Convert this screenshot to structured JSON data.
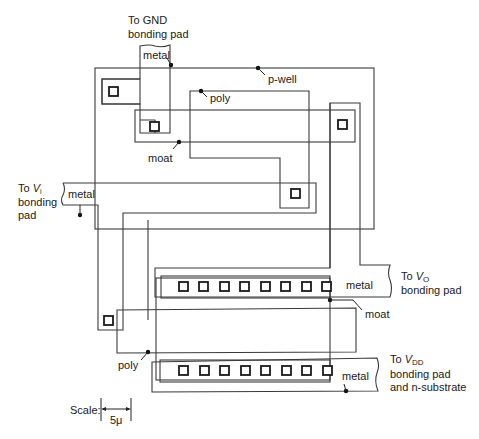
{
  "figure": {
    "type": "CMOS inverter layout",
    "labels": {
      "gnd_pad": [
        "To GND",
        "bonding pad"
      ],
      "vi_pad": [
        "To ",
        "V",
        "i",
        "bonding",
        "pad"
      ],
      "vo_pad": [
        "To ",
        "V",
        "O",
        "bonding pad"
      ],
      "vdd_pad": [
        "To ",
        "V",
        "DD",
        "bonding pad",
        "and n-substrate"
      ],
      "p_well": "p-well",
      "poly_top": "poly",
      "poly_bottom": "poly",
      "moat_top": "moat",
      "moat_bottom": "moat",
      "metal_gnd": "metal",
      "metal_vi": "metal",
      "metal_vo": "metal",
      "metal_vdd": "metal"
    },
    "scale": {
      "label": "Scale:",
      "value": "5μ"
    },
    "contact_rows": {
      "vo_row_count": 8,
      "vdd_row_count": 8
    },
    "colors": {
      "line": "#3a3a3a",
      "text": "#1a1a1a",
      "background": "#ffffff"
    }
  }
}
